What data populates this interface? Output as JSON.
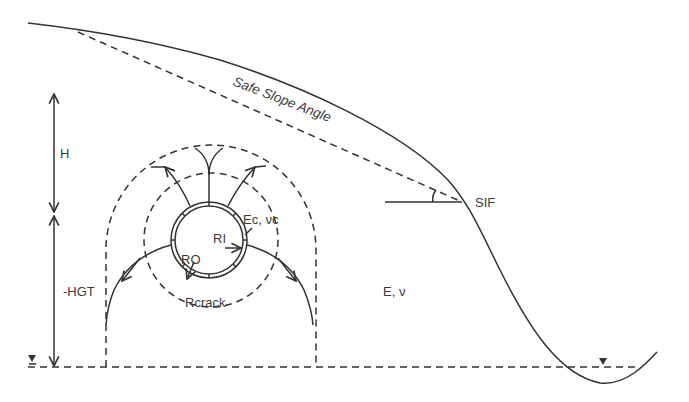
{
  "figure": {
    "type": "geotechnical cross-section",
    "labels": {
      "safe_slope": "Safe Slope Angle",
      "sif": "SIF",
      "height": "H",
      "depth": "-HGT",
      "pipe_material": "Ec, νc",
      "inner_radius": "RI",
      "outer_radius": "RO",
      "crack_radius": "Rcrack",
      "soil_material": "E, ν"
    },
    "colors": {
      "line": "#333333",
      "text": "#3a3a3a",
      "background": "#ffffff"
    },
    "elements": [
      "ground-surface-curve",
      "safe-slope-dashed-line",
      "sif-reference-line",
      "slope-angle-arc",
      "water-table-line",
      "water-table-markers",
      "height-dimension-arrow",
      "depth-dimension-arrow",
      "influence-zone-arch",
      "crack-zone-circle",
      "pipe-cross-section",
      "stress-flow-arrows"
    ]
  }
}
